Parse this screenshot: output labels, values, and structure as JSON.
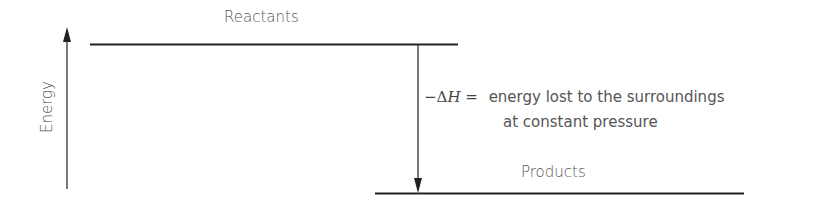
{
  "diagram": {
    "type": "energy-level-diagram",
    "axis_label": "Energy",
    "levels": [
      {
        "name": "reactants",
        "label": "Reactants"
      },
      {
        "name": "products",
        "label": "Products"
      }
    ],
    "enthalpy": {
      "symbol_prefix": "−Δ",
      "symbol_var": "H",
      "equals": " =",
      "line1": "energy lost to the surroundings",
      "line2": "at constant pressure"
    }
  }
}
